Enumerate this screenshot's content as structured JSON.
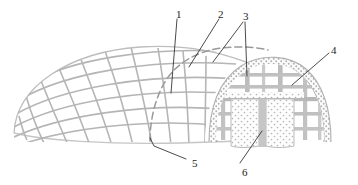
{
  "figure": {
    "background_color": "#ffffff",
    "line_color": "#a8a8a8",
    "dark_line_color": "#8f8f8f",
    "leader_color": "#2b2b2b",
    "label_color": "#1c1c1c",
    "fill_color": "#fbfbfb",
    "stipple_color": "#bcbcbc"
  },
  "callouts": [
    {
      "id": "1",
      "label": "1",
      "x": 176,
      "y": 9,
      "target": "grid-shell-rib"
    },
    {
      "id": "2",
      "label": "2",
      "x": 218,
      "y": 9,
      "target": "cut-plane-edge"
    },
    {
      "id": "3",
      "label": "3",
      "x": 243,
      "y": 11,
      "target": "arch-shell-band"
    },
    {
      "id": "4",
      "label": "4",
      "x": 331,
      "y": 45,
      "target": "arch-shell-band-right"
    },
    {
      "id": "5",
      "label": "5",
      "x": 192,
      "y": 158,
      "target": "base-ring-edge"
    },
    {
      "id": "6",
      "label": "6",
      "x": 242,
      "y": 167,
      "target": "infill-column"
    }
  ],
  "parts": {
    "grid_shell": "grid shell dome surface",
    "cut_plane": "cut plane dashed boundary",
    "arch_band": "stippled arch shell band",
    "section_frame": "internal section framing grid",
    "infill_columns": "stippled infill columns",
    "base_ring": "base ring edge"
  }
}
